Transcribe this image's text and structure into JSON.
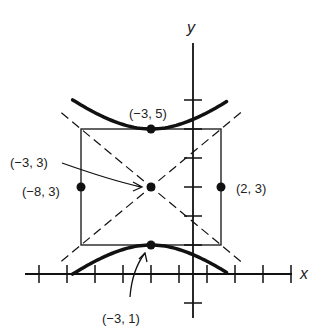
{
  "diagram": {
    "type": "hyperbola-graph",
    "equation": "(y-3)^2/4 - (x+3)^2/25 = 1",
    "center": {
      "x": -3,
      "y": 3
    },
    "axes": {
      "x_label": "x",
      "y_label": "y",
      "x_range": [
        -13,
        9
      ],
      "y_range": [
        -2,
        9
      ],
      "tick_step_x": 2,
      "tick_step_y": 1
    },
    "rectangle": {
      "x_min": -8,
      "x_max": 2,
      "y_min": 1,
      "y_max": 5
    },
    "asymptotes": [
      {
        "slope": 0.4,
        "through": {
          "x": -3,
          "y": 3
        }
      },
      {
        "slope": -0.4,
        "through": {
          "x": -3,
          "y": 3
        }
      }
    ],
    "points": [
      {
        "x": -3,
        "y": 5,
        "label": "(−3, 5)"
      },
      {
        "x": -3,
        "y": 3,
        "label": "(−3, 3)"
      },
      {
        "x": -8,
        "y": 3,
        "label": "(−8, 3)"
      },
      {
        "x": 2,
        "y": 3,
        "label": "(2, 3)"
      },
      {
        "x": -3,
        "y": 1,
        "label": "(−3, 1)"
      }
    ],
    "colors": {
      "ink": "#111111",
      "background": "#ffffff"
    }
  }
}
